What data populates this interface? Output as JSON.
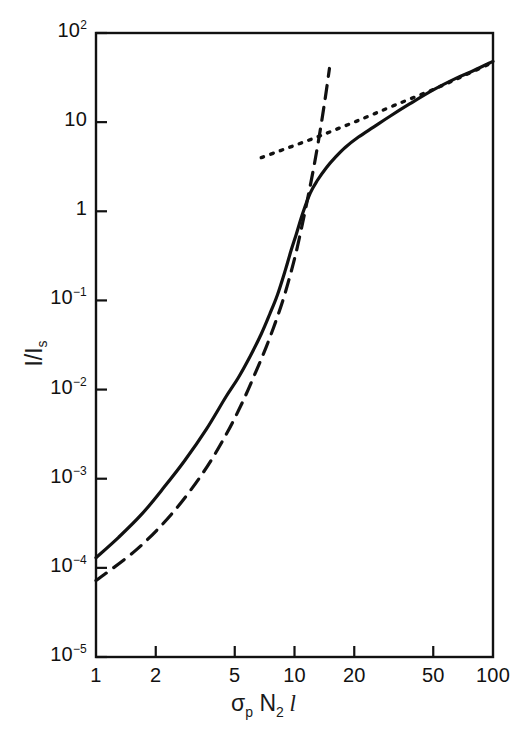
{
  "figure": {
    "background_color": "#ffffff",
    "line_color": "#111111"
  },
  "axes": {
    "y_title_main": "I/I",
    "y_title_sub": "s",
    "x_title_sigma": "σ",
    "x_title_sigma_sub": "p",
    "x_title_n": " N",
    "x_title_n_sub": "2",
    "x_title_l": " l",
    "y_ticks": [
      {
        "label_base": "10",
        "label_exp": "2",
        "value": 100
      },
      {
        "label_base": "10",
        "label_exp": "",
        "value": 10
      },
      {
        "label_base": "1",
        "label_exp": "",
        "value": 1
      },
      {
        "label_base": "10",
        "label_exp": "-1",
        "value": 0.1
      },
      {
        "label_base": "10",
        "label_exp": "-2",
        "value": 0.01
      },
      {
        "label_base": "10",
        "label_exp": "-3",
        "value": 0.001
      },
      {
        "label_base": "10",
        "label_exp": "-4",
        "value": 0.0001
      },
      {
        "label_base": "10",
        "label_exp": "-5",
        "value": 1e-05
      }
    ],
    "x_ticks": [
      {
        "label": "1",
        "value": 1
      },
      {
        "label": "2",
        "value": 2
      },
      {
        "label": "5",
        "value": 5
      },
      {
        "label": "10",
        "value": 10
      },
      {
        "label": "20",
        "value": 20
      },
      {
        "label": "50",
        "value": 50
      },
      {
        "label": "100",
        "value": 100
      }
    ]
  },
  "chart_data": {
    "type": "line",
    "title": "",
    "xlabel": "σ_p N_2 l",
    "ylabel": "I/I_s",
    "xscale": "log",
    "yscale": "log",
    "xlim": [
      1,
      100
    ],
    "ylim": [
      1e-05,
      100
    ],
    "grid": false,
    "legend": "none",
    "series": [
      {
        "name": "saturated-output",
        "style": "solid",
        "color": "#111111",
        "x": [
          1.0,
          1.3,
          1.7,
          2.2,
          2.8,
          3.6,
          4.5,
          5.2,
          6.0,
          6.8,
          7.5,
          8.2,
          9.0,
          9.6,
          10.2,
          11.0,
          12.0,
          13.0,
          14.5,
          16.0,
          18.0,
          21.0,
          25.0,
          30.0,
          38.0,
          50.0,
          65.0,
          80.0,
          100.0
        ],
        "y": [
          0.00013,
          0.00022,
          0.0004,
          0.0008,
          0.0016,
          0.0036,
          0.0082,
          0.0135,
          0.024,
          0.042,
          0.07,
          0.115,
          0.22,
          0.36,
          0.55,
          0.95,
          1.6,
          2.2,
          3.1,
          4.0,
          5.2,
          6.8,
          8.8,
          11.5,
          16.0,
          23.0,
          31.0,
          38.0,
          48.0
        ]
      },
      {
        "name": "small-signal-exponential",
        "style": "dashed",
        "color": "#111111",
        "x": [
          1.0,
          1.6,
          2.4,
          3.4,
          4.4,
          5.4,
          6.4,
          7.2,
          8.0,
          8.8,
          9.5,
          10.2,
          11.0,
          11.8,
          12.6,
          13.4,
          14.2,
          15.0
        ],
        "y": [
          7.2e-05,
          0.00016,
          0.0004,
          0.0011,
          0.0028,
          0.0068,
          0.016,
          0.03,
          0.056,
          0.105,
          0.19,
          0.35,
          0.75,
          1.6,
          3.4,
          7.5,
          17.0,
          40.0
        ]
      },
      {
        "name": "saturated-asymptote",
        "style": "dotted",
        "color": "#111111",
        "x": [
          6.8,
          8.5,
          10.5,
          13.0,
          16.0,
          20.0,
          25.0,
          32.0,
          42.0,
          55.0,
          72.0,
          100.0
        ],
        "y": [
          4.0,
          4.8,
          5.7,
          6.8,
          8.2,
          10.0,
          12.3,
          15.5,
          19.8,
          25.5,
          33.5,
          47.0
        ]
      }
    ]
  },
  "geometry": {
    "left": 96,
    "right": 493,
    "top": 33,
    "bottom": 657,
    "x_log_min": 0,
    "x_log_max": 2,
    "y_log_min": -5,
    "y_log_max": 2,
    "tick_len_major": 11,
    "tick_len_minor": 7,
    "frame_stroke": 2.4,
    "curve_stroke": 3.2,
    "dash_pattern": "13,9",
    "dot_pattern": "2.6,7.5"
  }
}
